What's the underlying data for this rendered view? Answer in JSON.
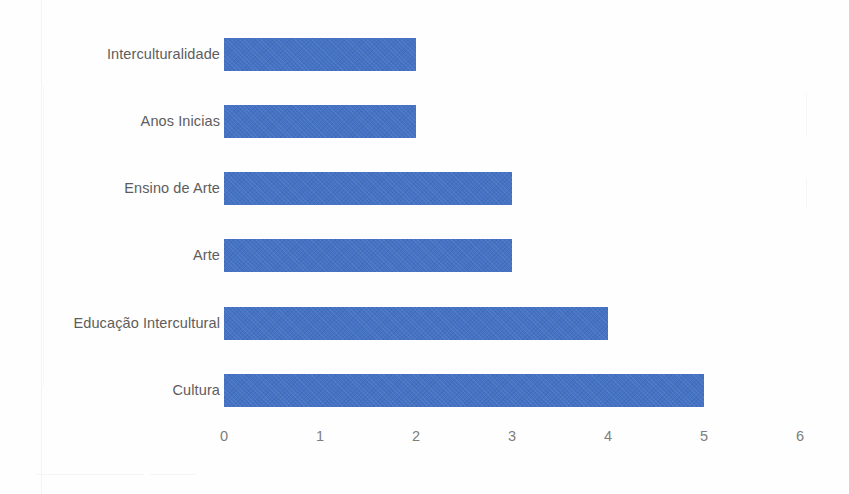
{
  "chart_data": {
    "type": "bar",
    "orientation": "horizontal",
    "title": "",
    "subtitle": "",
    "xlabel": "",
    "ylabel": "",
    "categories": [
      "Interculturalidade",
      "Anos Inicias",
      "Ensino de Arte",
      "Arte",
      "Educação Intercultural",
      "Cultura"
    ],
    "values": [
      2,
      2,
      3,
      3,
      4,
      5
    ],
    "xlim": [
      0,
      6
    ],
    "xticks": [
      "0",
      "1",
      "2",
      "3",
      "4",
      "5",
      "6"
    ],
    "grid": false,
    "legend": false,
    "legend_position": "none",
    "series": [
      {
        "name": "",
        "values": [
          2,
          2,
          3,
          3,
          4,
          5
        ]
      }
    ],
    "colors": {
      "bar": "#4472C4",
      "category_label": "#5D5D5D",
      "tick_label": "#7D7D7D",
      "background": "#FEFEFE"
    }
  }
}
